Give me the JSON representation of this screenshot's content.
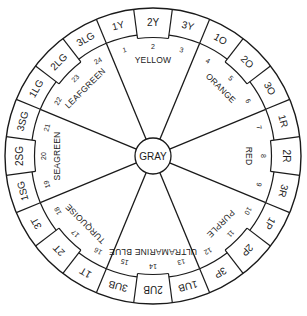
{
  "diagram": {
    "type": "hue-circle",
    "center_label": "GRAY",
    "colors": {
      "line": "#1a1a1a",
      "background": "#ffffff"
    },
    "hues": [
      {
        "name": "YELLOW",
        "cells": [
          "1Y",
          "2Y",
          "3Y"
        ],
        "numbers": [
          "1",
          "2",
          "3"
        ]
      },
      {
        "name": "ORANGE",
        "cells": [
          "1O",
          "2O",
          "3O"
        ],
        "numbers": [
          "4",
          "5",
          "6"
        ]
      },
      {
        "name": "RED",
        "cells": [
          "1R",
          "2R",
          "3R"
        ],
        "numbers": [
          "7",
          "8",
          "9"
        ]
      },
      {
        "name": "PURPLE",
        "cells": [
          "1P",
          "2P",
          "3P"
        ],
        "numbers": [
          "10",
          "11",
          "12"
        ]
      },
      {
        "name": "ULTRAMARINE BLUE",
        "cells": [
          "1UB",
          "2UB",
          "3UB"
        ],
        "numbers": [
          "13",
          "14",
          "15"
        ]
      },
      {
        "name": "TURQUOISE",
        "cells": [
          "1T",
          "2T",
          "3T"
        ],
        "numbers": [
          "16",
          "17",
          "18"
        ]
      },
      {
        "name": "SEAGREEN",
        "cells": [
          "1SG",
          "2SG",
          "3SG"
        ],
        "numbers": [
          "19",
          "20",
          "21"
        ]
      },
      {
        "name": "LEAFGREEN",
        "cells": [
          "1LG",
          "2LG",
          "3LG"
        ],
        "numbers": [
          "22",
          "23",
          "24"
        ]
      }
    ]
  }
}
